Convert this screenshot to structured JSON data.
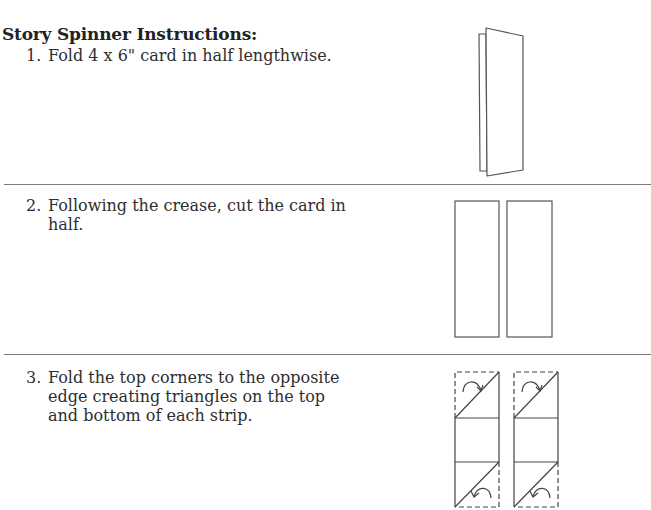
{
  "document": {
    "title": "Story Spinner Instructions:",
    "steps": [
      {
        "number": "1.",
        "text": "Fold 4 x 6\" card in half lengthwise.",
        "illustration": "folded-card"
      },
      {
        "number": "2.",
        "text": "Following the crease, cut the card in half.",
        "illustration": "two-strips"
      },
      {
        "number": "3.",
        "text": "Fold the top corners to the opposite edge creating triangles on the top and bottom of each strip.",
        "illustration": "folded-corner-strips"
      }
    ]
  },
  "colors": {
    "text": "#2e2e2e",
    "line": "#555555",
    "divider": "#7a7a7a"
  }
}
